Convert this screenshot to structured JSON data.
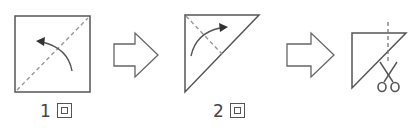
{
  "diagram": {
    "title": "",
    "steps": [
      {
        "id": "step1",
        "shape": "square",
        "fold": "diagonal",
        "label_number": "1",
        "label_suffix_glyph": "回",
        "label": "1回"
      },
      {
        "id": "step2",
        "shape": "triangle",
        "fold": "diagonal",
        "label_number": "2",
        "label_suffix_glyph": "回",
        "label": "2回"
      },
      {
        "id": "step3",
        "shape": "folded-triangle",
        "action": "cut",
        "label": ""
      }
    ],
    "arrows": [
      {
        "from": "step1",
        "to": "step2",
        "style": "outline-block-arrow"
      },
      {
        "from": "step2",
        "to": "step3",
        "style": "outline-block-arrow"
      }
    ],
    "icons": [
      "curved-fold-arrow-icon",
      "scissors-icon",
      "dashed-fold-line",
      "dashed-cut-line"
    ],
    "colors": {
      "stroke": "#555555",
      "dash": "#888888",
      "background": "#ffffff"
    }
  }
}
